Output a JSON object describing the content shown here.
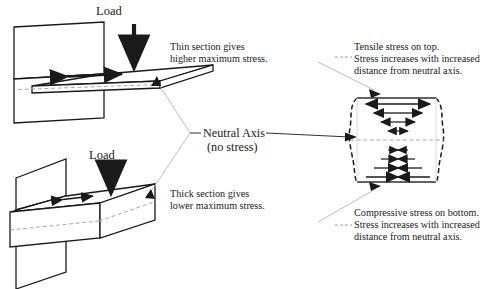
{
  "figure": {
    "title_hidden": "",
    "colors": {
      "ink": "#1a1a1a",
      "leader": "#9a9a9a",
      "neutral_axis_line": "#a8a8a8",
      "background": "#ffffff"
    }
  },
  "labels": {
    "load_top": "Load",
    "load_bottom": "Load",
    "thin_note_line1": "Thin section gives",
    "thin_note_line2": "higher maximum stress.",
    "thick_note_line1": "Thick section gives",
    "thick_note_line2": "lower maximum stress.",
    "neutral_axis_line1": "Neutral Axis",
    "neutral_axis_line2": "(no stress)",
    "tensile_line1": "Tensile stress on top.",
    "tensile_line2": "Stress increases with increased",
    "tensile_line3": "distance from neutral axis.",
    "compressive_line1": "Compressive stress on bottom.",
    "compressive_line2": "Stress increases with increased",
    "compressive_line3": "distance from neutral axis."
  },
  "diagram": {
    "thin_beam": {
      "name": "thin-section-cantilever",
      "section": "thin",
      "load_direction": "down",
      "top_surface_arrow": "double-headed-horizontal",
      "neutral_axis_shown": true
    },
    "thick_beam": {
      "name": "thick-section-cantilever",
      "section": "thick",
      "load_direction": "down",
      "top_surface_arrow": "double-headed-horizontal",
      "neutral_axis_shown": true
    },
    "stress_block": {
      "name": "bending-stress-distribution",
      "above_axis": "tension",
      "below_axis": "compression",
      "arrow_rows_tension": 4,
      "arrow_rows_compression": 4,
      "max_stress_location": "outer fibers",
      "zero_stress_location": "neutral axis"
    }
  }
}
